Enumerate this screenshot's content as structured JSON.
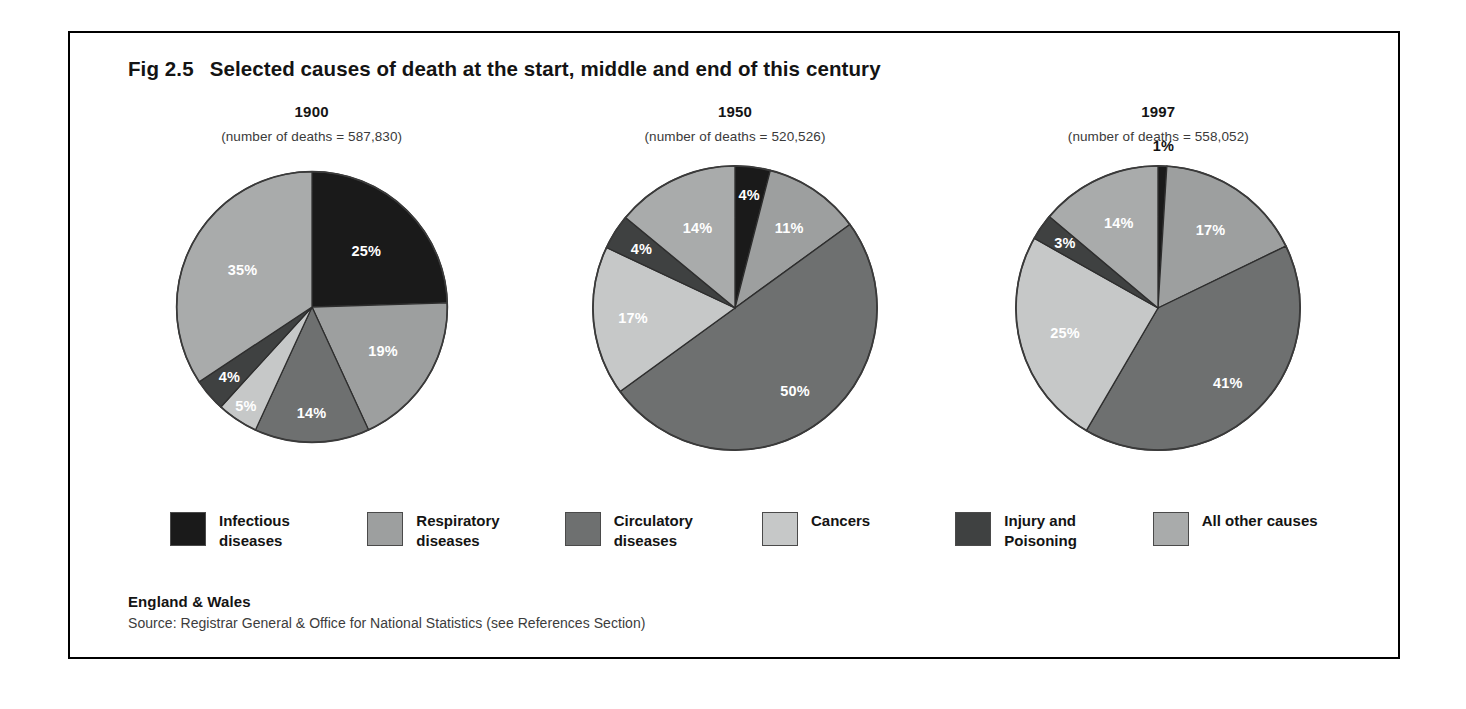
{
  "figure": {
    "number": "Fig 2.5",
    "title": "Selected causes of death at the start, middle and end of this century"
  },
  "footer": {
    "region": "England & Wales",
    "source": "Source:  Registrar General &  Office for National Statistics (see References Section)"
  },
  "legend": {
    "items": [
      {
        "label": "Infectious diseases",
        "color": "#1a1a1a",
        "key": "infectious"
      },
      {
        "label": "Respiratory diseases",
        "color": "#9d9f9f",
        "key": "respiratory"
      },
      {
        "label": "Circulatory diseases",
        "color": "#6e7070",
        "key": "circulatory"
      },
      {
        "label": "Cancers",
        "color": "#c6c8c8",
        "key": "cancers"
      },
      {
        "label": "Injury and Poisoning",
        "color": "#3f4141",
        "key": "injury"
      },
      {
        "label": "All other causes",
        "color": "#a9abab",
        "key": "other"
      }
    ]
  },
  "panels": [
    {
      "year": "1900",
      "subtitle": "(number of deaths = 587,830)",
      "deaths": 587830
    },
    {
      "year": "1950",
      "subtitle": "(number of deaths = 520,526)",
      "deaths": 520526
    },
    {
      "year": "1997",
      "subtitle": "(number of deaths = 558,052)",
      "deaths": 558052
    }
  ],
  "chart_data": {
    "type": "pie",
    "title": "Selected causes of death at the start, middle and end of this century",
    "unit": "percent of all deaths",
    "categories": [
      "Infectious diseases",
      "Respiratory diseases",
      "Circulatory diseases",
      "Cancers",
      "Injury and Poisoning",
      "All other causes"
    ],
    "colors": [
      "#1a1a1a",
      "#9d9f9f",
      "#6e7070",
      "#c6c8c8",
      "#3f4141",
      "#a9abab"
    ],
    "legend_position": "bottom",
    "charts": [
      {
        "name": "1900",
        "subtitle": "(number of deaths = 587,830)",
        "total_deaths": 587830,
        "values": [
          25,
          19,
          14,
          5,
          4,
          35
        ],
        "labels": [
          "25%",
          "19%",
          "14%",
          "5%",
          "4%",
          "35%"
        ]
      },
      {
        "name": "1950",
        "subtitle": "(number of deaths = 520,526)",
        "total_deaths": 520526,
        "values": [
          4,
          11,
          50,
          17,
          4,
          14
        ],
        "labels": [
          "4%",
          "11%",
          "50%",
          "17%",
          "4%",
          "14%"
        ]
      },
      {
        "name": "1997",
        "subtitle": "(number of deaths = 558,052)",
        "total_deaths": 558052,
        "values": [
          1,
          17,
          41,
          25,
          3,
          14
        ],
        "labels": [
          "1%",
          "17%",
          "41%",
          "25%",
          "3%",
          "14%"
        ]
      }
    ]
  }
}
